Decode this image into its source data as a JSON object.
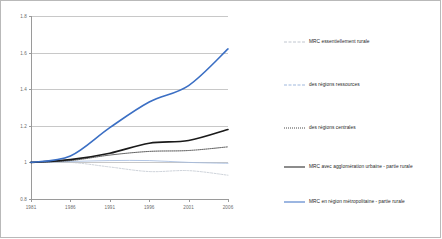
{
  "chart_data": {
    "type": "line",
    "title": "",
    "subtitle": "",
    "xlabel": "",
    "ylabel": "",
    "x": [
      1981,
      1986,
      1991,
      1996,
      2001,
      2006
    ],
    "xticklabels": [
      "1981",
      "1986",
      "1991",
      "1996",
      "2001",
      "2006"
    ],
    "yticklabels": [
      "0.8",
      "1",
      "1.2",
      "1.4",
      "1.6",
      "1.8"
    ],
    "yticks": [
      0.8,
      1.0,
      1.2,
      1.4,
      1.6,
      1.8
    ],
    "ylim": [
      0.8,
      1.8
    ],
    "xlim": [
      1981,
      2006
    ],
    "grid": "horizontal",
    "legend_position": "right",
    "series": [
      {
        "name": "MRC essentiellement rurale",
        "style": "dashed",
        "color": "#c0c6cf",
        "values": [
          1.0,
          1.0,
          0.975,
          0.95,
          0.955,
          0.93
        ]
      },
      {
        "name": "des régions ressources",
        "style": "solid-thin",
        "color": "#9fb8dd",
        "values": [
          1.0,
          1.005,
          1.01,
          1.01,
          1.0,
          0.995
        ]
      },
      {
        "name": "des régions centrales",
        "style": "dotted",
        "color": "#4a4a4a",
        "values": [
          1.0,
          1.01,
          1.04,
          1.06,
          1.065,
          1.085
        ]
      },
      {
        "name": "MRC avec agglomération urbaine - partie rurale",
        "style": "solid",
        "color": "#1a1a1a",
        "values": [
          1.0,
          1.015,
          1.05,
          1.105,
          1.12,
          1.18
        ]
      },
      {
        "name": "MRC en région métropolitaine - partie rurale",
        "style": "solid",
        "color": "#3b6fc4",
        "values": [
          1.0,
          1.035,
          1.19,
          1.33,
          1.42,
          1.62
        ]
      }
    ]
  },
  "legend": {
    "items": [
      {
        "label": "MRC essentiellement rurale"
      },
      {
        "label": "des régions ressources"
      },
      {
        "label": "des régions centrales"
      },
      {
        "label": "MRC avec agglomération urbaine - partie rurale"
      },
      {
        "label": "MRC en région métropolitaine - partie rurale"
      }
    ]
  },
  "colors": {
    "blue": "#3b6fc4",
    "black": "#1a1a1a",
    "light_blue": "#9fb8dd",
    "grey_dot": "#4a4a4a",
    "light_grey": "#c0c6cf",
    "grid": "#c8c8c8",
    "axis": "#9a9a9a",
    "border": "#b9b9b9"
  }
}
